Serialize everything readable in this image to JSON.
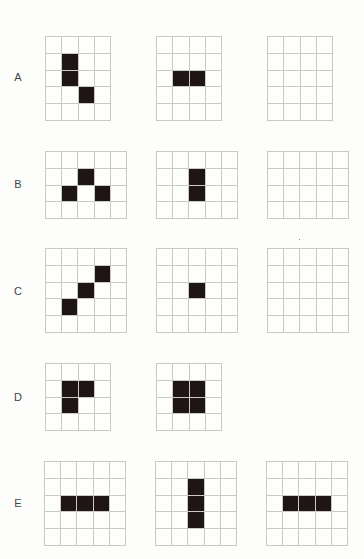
{
  "figure": {
    "colors": {
      "background": "#fdfdfb",
      "grid_line": "#c9c9c6",
      "filled_cell": "#1f1517",
      "label": "#444444"
    },
    "rows": [
      {
        "label": "A",
        "label_pos": [
          11,
          71
        ],
        "cols": 4,
        "rows": 5,
        "grids": [
          {
            "x": 45,
            "y": 36,
            "w": 66,
            "h": 85,
            "filled": [
              [
                1,
                1
              ],
              [
                2,
                1
              ],
              [
                3,
                2
              ]
            ]
          },
          {
            "x": 156,
            "y": 36,
            "w": 66,
            "h": 85,
            "filled": [
              [
                2,
                1
              ],
              [
                2,
                2
              ]
            ]
          },
          {
            "x": 267,
            "y": 36,
            "w": 66,
            "h": 85,
            "filled": []
          }
        ]
      },
      {
        "label": "B",
        "label_pos": [
          11,
          178
        ],
        "cols": 5,
        "rows": 4,
        "grids": [
          {
            "x": 45,
            "y": 151,
            "w": 82,
            "h": 68,
            "filled": [
              [
                1,
                2
              ],
              [
                2,
                1
              ],
              [
                2,
                3
              ]
            ]
          },
          {
            "x": 156,
            "y": 151,
            "w": 82,
            "h": 68,
            "filled": [
              [
                1,
                2
              ],
              [
                2,
                2
              ]
            ]
          },
          {
            "x": 267,
            "y": 151,
            "w": 82,
            "h": 68,
            "filled": []
          }
        ]
      },
      {
        "label": "C",
        "label_pos": [
          11,
          285
        ],
        "cols": 5,
        "rows": 5,
        "grids": [
          {
            "x": 45,
            "y": 248,
            "w": 82,
            "h": 85,
            "filled": [
              [
                1,
                3
              ],
              [
                2,
                2
              ],
              [
                3,
                1
              ]
            ]
          },
          {
            "x": 156,
            "y": 248,
            "w": 82,
            "h": 85,
            "filled": [
              [
                2,
                2
              ]
            ]
          },
          {
            "x": 267,
            "y": 248,
            "w": 82,
            "h": 85,
            "filled": []
          }
        ]
      },
      {
        "label": "D",
        "label_pos": [
          11,
          391
        ],
        "cols": 4,
        "rows": 4,
        "grids": [
          {
            "x": 45,
            "y": 363,
            "w": 66,
            "h": 68,
            "filled": [
              [
                1,
                1
              ],
              [
                1,
                2
              ],
              [
                2,
                1
              ]
            ]
          },
          {
            "x": 156,
            "y": 363,
            "w": 66,
            "h": 68,
            "filled": [
              [
                1,
                1
              ],
              [
                1,
                2
              ],
              [
                2,
                1
              ],
              [
                2,
                2
              ]
            ]
          }
        ]
      },
      {
        "label": "E",
        "label_pos": [
          11,
          497
        ],
        "cols": 5,
        "rows": 5,
        "grids": [
          {
            "x": 44,
            "y": 461,
            "w": 82,
            "h": 85,
            "filled": [
              [
                2,
                1
              ],
              [
                2,
                2
              ],
              [
                2,
                3
              ]
            ]
          },
          {
            "x": 155,
            "y": 461,
            "w": 82,
            "h": 85,
            "filled": [
              [
                1,
                2
              ],
              [
                2,
                2
              ],
              [
                3,
                2
              ]
            ]
          },
          {
            "x": 266,
            "y": 461,
            "w": 82,
            "h": 85,
            "filled": [
              [
                2,
                1
              ],
              [
                2,
                2
              ],
              [
                2,
                3
              ]
            ]
          }
        ]
      }
    ]
  }
}
